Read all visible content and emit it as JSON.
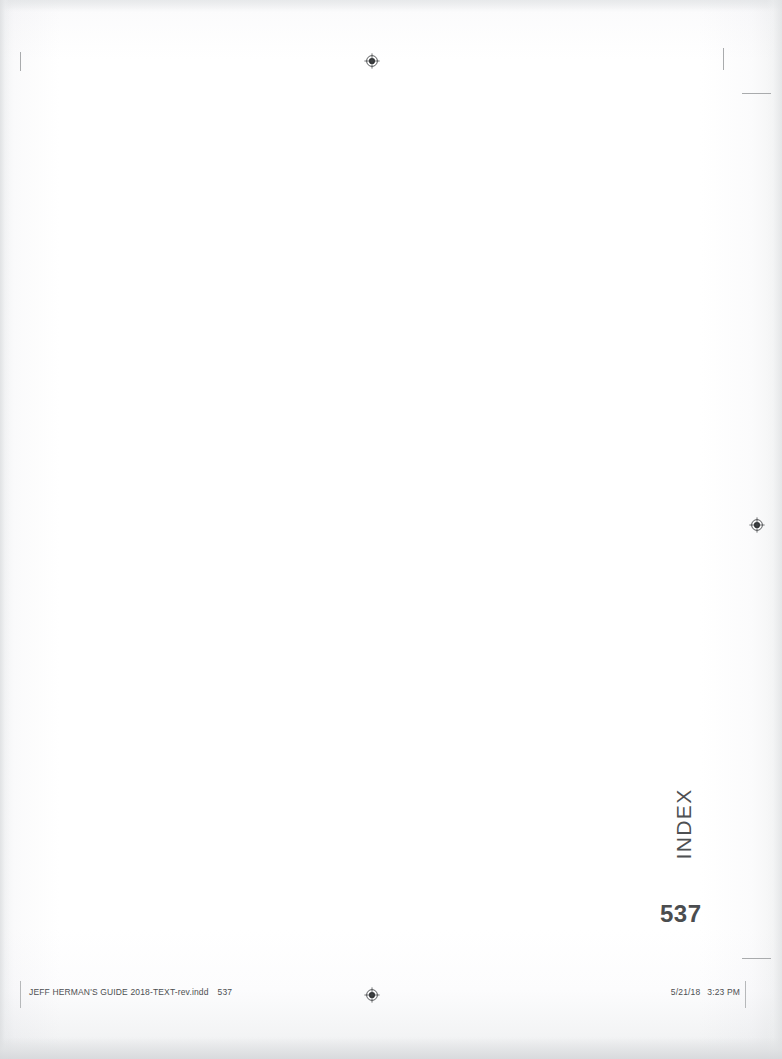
{
  "page": {
    "section_tab": "INDEX",
    "folio": "537",
    "background_color": "#ffffff",
    "text_color": "#4d4f51"
  },
  "slug": {
    "filename": "JEFF HERMAN'S GUIDE 2018-TEXT-rev.indd",
    "page_number": "537",
    "date": "5/21/18",
    "time": "3:23 PM"
  },
  "printer_marks": {
    "registration_marks": [
      {
        "name": "registration-mark-top",
        "x": 364,
        "y": 53
      },
      {
        "name": "registration-mark-right",
        "x": 749,
        "y": 517
      },
      {
        "name": "registration-mark-bottom",
        "x": 364,
        "y": 987
      }
    ],
    "crop_marks": [
      {
        "name": "crop-mark-top-left-vertical",
        "x": 20,
        "y": 52,
        "w": 1,
        "h": 19,
        "orient": "vert"
      },
      {
        "name": "crop-mark-top-right-vertical",
        "x": 723,
        "y": 48,
        "w": 1,
        "h": 22,
        "orient": "vert"
      },
      {
        "name": "crop-mark-top-right-horizontal",
        "x": 742,
        "y": 93,
        "w": 29,
        "h": 1,
        "orient": "horz"
      },
      {
        "name": "crop-mark-bottom-right-horizontal",
        "x": 742,
        "y": 958,
        "w": 29,
        "h": 1,
        "orient": "horz"
      }
    ],
    "slug_rules": [
      {
        "name": "slug-rule-left",
        "x": 20,
        "y": 981,
        "h": 27
      },
      {
        "name": "slug-rule-right",
        "x": 745,
        "y": 981,
        "h": 27
      }
    ]
  }
}
